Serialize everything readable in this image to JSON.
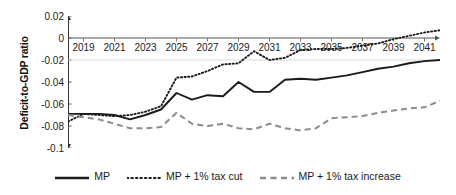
{
  "chart_data": {
    "type": "line",
    "title": "",
    "xlabel": "",
    "ylabel": "Deficit-to-GDP ratio",
    "xlim": [
      2018,
      2042
    ],
    "ylim": [
      -0.1,
      0.02
    ],
    "yticks": [
      0.02,
      0,
      -0.02,
      -0.04,
      -0.06,
      -0.08,
      -0.1
    ],
    "ytick_labels": [
      "0.02",
      "0",
      "-0.02",
      "-0.04",
      "-0.06",
      "-0.08",
      "-0.1"
    ],
    "xticks": [
      2019,
      2021,
      2023,
      2025,
      2027,
      2029,
      2031,
      2033,
      2035,
      2037,
      2039,
      2041
    ],
    "xtick_labels": [
      "2019",
      "2021",
      "2023",
      "2025",
      "2027",
      "2029",
      "2031",
      "2033",
      "2035",
      "2037",
      "2039",
      "2041"
    ],
    "grid": false,
    "zero_line": true,
    "legend_position": "bottom",
    "x": [
      2018,
      2019,
      2020,
      2021,
      2022,
      2023,
      2024,
      2025,
      2026,
      2027,
      2028,
      2029,
      2030,
      2031,
      2032,
      2033,
      2034,
      2035,
      2036,
      2037,
      2038,
      2039,
      2040,
      2041,
      2042
    ],
    "series": [
      {
        "name": "MP",
        "style": "solid",
        "color": "#1a1a1a",
        "values": [
          -0.069,
          -0.069,
          -0.069,
          -0.07,
          -0.074,
          -0.07,
          -0.065,
          -0.05,
          -0.056,
          -0.052,
          -0.053,
          -0.04,
          -0.049,
          -0.049,
          -0.038,
          -0.037,
          -0.038,
          -0.036,
          -0.034,
          -0.031,
          -0.028,
          -0.026,
          -0.023,
          -0.021,
          -0.02
        ]
      },
      {
        "name": "MP + 1% tax cut",
        "style": "dotted",
        "color": "#1a1a1a",
        "values": [
          -0.076,
          -0.069,
          -0.07,
          -0.071,
          -0.07,
          -0.067,
          -0.062,
          -0.036,
          -0.035,
          -0.03,
          -0.024,
          -0.023,
          -0.012,
          -0.02,
          -0.018,
          -0.011,
          -0.01,
          -0.01,
          -0.009,
          -0.007,
          -0.005,
          -0.001,
          0.002,
          0.005,
          0.007
        ]
      },
      {
        "name": "MP + 1% tax increase",
        "style": "dashed",
        "color": "#8c8c8c",
        "values": [
          -0.07,
          -0.072,
          -0.074,
          -0.078,
          -0.082,
          -0.082,
          -0.081,
          -0.068,
          -0.078,
          -0.08,
          -0.078,
          -0.082,
          -0.083,
          -0.078,
          -0.082,
          -0.084,
          -0.082,
          -0.073,
          -0.072,
          -0.071,
          -0.068,
          -0.066,
          -0.064,
          -0.063,
          -0.057
        ]
      }
    ],
    "legend": [
      {
        "label": "MP",
        "style": "solid",
        "color": "#1a1a1a"
      },
      {
        "label": "MP + 1% tax cut",
        "style": "dotted",
        "color": "#1a1a1a"
      },
      {
        "label": "MP + 1% tax increase",
        "style": "dashed",
        "color": "#8c8c8c"
      }
    ]
  }
}
